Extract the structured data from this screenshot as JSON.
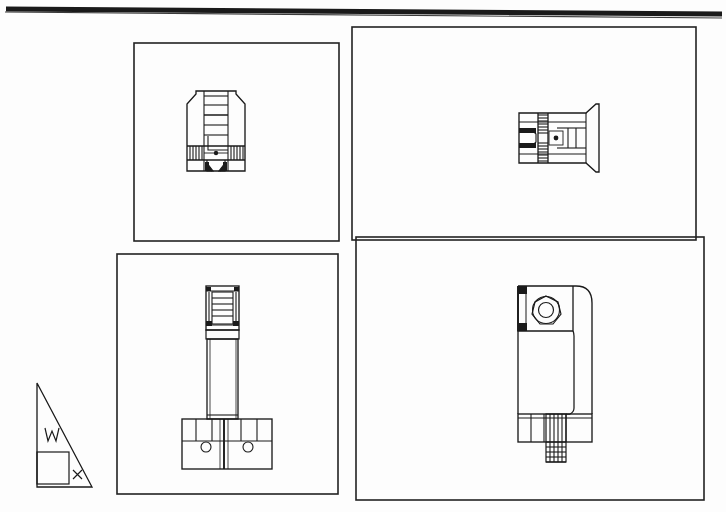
{
  "document": {
    "kind": "engineering-drawing",
    "title": "C-Clamp Orthographic Multi-View Drawing",
    "sheet_background": "#fdfdfd",
    "ink_color": "#1a1a1a",
    "line_color": "#222222"
  },
  "sheet_border": {
    "top_rule": {
      "present": true,
      "x1": 6,
      "y1": 9,
      "x2": 722,
      "y2": 14,
      "thickness": 4,
      "note": "heavy slightly-skewed scanned top border rule"
    },
    "left_rule": {
      "present": false
    },
    "right_rule": {
      "present": false
    }
  },
  "panels": [
    {
      "id": "panel-top-left",
      "name": "front-view-panel",
      "label": "Front View",
      "x": 134,
      "y": 43,
      "width": 205,
      "height": 198,
      "stroke": "#222222",
      "stroke_width": 1.6
    },
    {
      "id": "panel-top-right",
      "name": "top-view-panel",
      "label": "Top View",
      "x": 352,
      "y": 27,
      "width": 344,
      "height": 213,
      "stroke": "#222222",
      "stroke_width": 1.6
    },
    {
      "id": "panel-bottom-left",
      "name": "side-view-panel",
      "label": "Side View",
      "x": 117,
      "y": 254,
      "width": 221,
      "height": 240,
      "stroke": "#222222",
      "stroke_width": 1.6
    },
    {
      "id": "panel-bottom-right",
      "name": "section-view-panel",
      "label": "Section View",
      "x": 356,
      "y": 237,
      "width": 348,
      "height": 263,
      "stroke": "#222222",
      "stroke_width": 1.6
    }
  ],
  "projection_symbol": {
    "name": "projection-angle-symbol",
    "description": "right triangle with inscribed square, letter W and letter x",
    "triangle": {
      "x1": 37,
      "y1": 383,
      "x2": 37,
      "y2": 487,
      "x3": 92,
      "y3": 487
    },
    "square": {
      "x": 37,
      "y": 452,
      "width": 31,
      "height": 31
    },
    "letter_w": {
      "text": "W",
      "x": 50,
      "y": 440
    },
    "letter_x": {
      "text": "x",
      "x": 76,
      "y": 478
    }
  },
  "views": {
    "front": {
      "name": "clamp-front-view",
      "center_x": 215,
      "center_y": 140,
      "features": [
        "chamfered-body-outline",
        "vertical-screw-shaft",
        "hatched-cross-band",
        "twin-solid-feet",
        "center-pin-dot"
      ]
    },
    "top": {
      "name": "clamp-top-view",
      "center_x": 548,
      "center_y": 137,
      "features": [
        "horizontal-body-outline",
        "chamfered-right-nose",
        "hatched-vertical-band",
        "twin-solid-jaw-tips",
        "center-pin-dot"
      ]
    },
    "side": {
      "name": "clamp-side-view",
      "center_x": 222,
      "center_y": 375,
      "features": [
        "threaded-screw-head",
        "long-plain-shank",
        "base-block-with-two-bores"
      ],
      "bores": [
        {
          "cx": 206,
          "cy": 447,
          "r": 5
        },
        {
          "cx": 248,
          "cy": 447,
          "r": 5
        }
      ]
    },
    "section": {
      "name": "clamp-section-view",
      "center_x": 555,
      "center_y": 375,
      "features": [
        "c-frame-profile",
        "rounded-outer-corner",
        "hex-nut-with-bore",
        "solid-keyway-blocks",
        "threaded-screw-stem",
        "lower-jaw-pad"
      ],
      "hex_nut": {
        "cx": 546,
        "cy": 312,
        "r_outer": 16,
        "r_inner": 8
      },
      "screw_thread": {
        "x": 548,
        "y": 428,
        "width": 20,
        "height": 48
      }
    }
  }
}
